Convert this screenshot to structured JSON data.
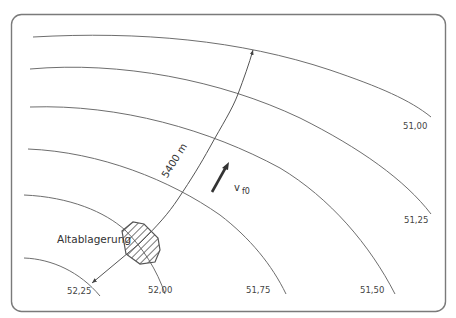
{
  "diagram": {
    "type": "groundwater-contour-map",
    "site_label": "Altablagerung",
    "distance_label": "5400 m",
    "flow_symbol": "v",
    "flow_subscript": "f0",
    "contours": [
      {
        "label": "51,00"
      },
      {
        "label": "51,25"
      },
      {
        "label": "51,50"
      },
      {
        "label": "51,75"
      },
      {
        "label": "52,00"
      },
      {
        "label": "52,25"
      }
    ],
    "colors": {
      "line": "#6e6e6e",
      "frame": "#777777",
      "hatch": "#555555",
      "text": "#444444"
    }
  }
}
